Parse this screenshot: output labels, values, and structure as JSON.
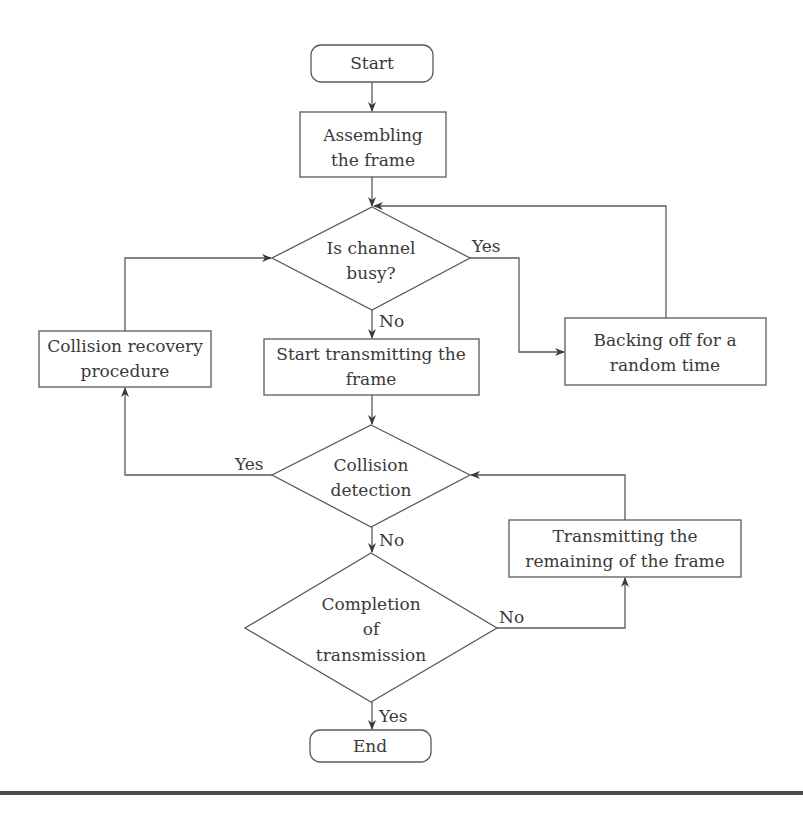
{
  "diagram": {
    "type": "flowchart",
    "nodes": {
      "start": {
        "label": "Start",
        "shape": "terminal"
      },
      "assemble": {
        "lines": [
          "Assembling",
          "the frame"
        ],
        "shape": "process"
      },
      "channel_busy": {
        "lines": [
          "Is channel",
          "busy?"
        ],
        "shape": "decision"
      },
      "backoff": {
        "lines": [
          "Backing off for a",
          "random time"
        ],
        "shape": "process"
      },
      "recovery": {
        "lines": [
          "Collision recovery",
          "procedure"
        ],
        "shape": "process"
      },
      "start_tx": {
        "lines": [
          "Start transmitting the",
          "frame"
        ],
        "shape": "process"
      },
      "collision": {
        "lines": [
          "Collision",
          "detection"
        ],
        "shape": "decision"
      },
      "tx_remaining": {
        "lines": [
          "Transmitting the",
          "remaining of the frame"
        ],
        "shape": "process"
      },
      "completion": {
        "lines": [
          "Completion",
          "of",
          "transmission"
        ],
        "shape": "decision"
      },
      "end": {
        "label": "End",
        "shape": "terminal"
      }
    },
    "edge_labels": {
      "busy_yes": "Yes",
      "busy_no": "No",
      "collision_yes": "Yes",
      "collision_no": "No",
      "completion_no": "No",
      "completion_yes": "Yes"
    },
    "edges": [
      {
        "from": "start",
        "to": "assemble"
      },
      {
        "from": "assemble",
        "to": "channel_busy"
      },
      {
        "from": "channel_busy",
        "to": "backoff",
        "label": "Yes"
      },
      {
        "from": "backoff",
        "to": "channel_busy"
      },
      {
        "from": "channel_busy",
        "to": "start_tx",
        "label": "No"
      },
      {
        "from": "start_tx",
        "to": "collision"
      },
      {
        "from": "collision",
        "to": "recovery",
        "label": "Yes"
      },
      {
        "from": "recovery",
        "to": "channel_busy"
      },
      {
        "from": "collision",
        "to": "completion",
        "label": "No"
      },
      {
        "from": "completion",
        "to": "tx_remaining",
        "label": "No"
      },
      {
        "from": "tx_remaining",
        "to": "collision"
      },
      {
        "from": "completion",
        "to": "end",
        "label": "Yes"
      }
    ]
  }
}
